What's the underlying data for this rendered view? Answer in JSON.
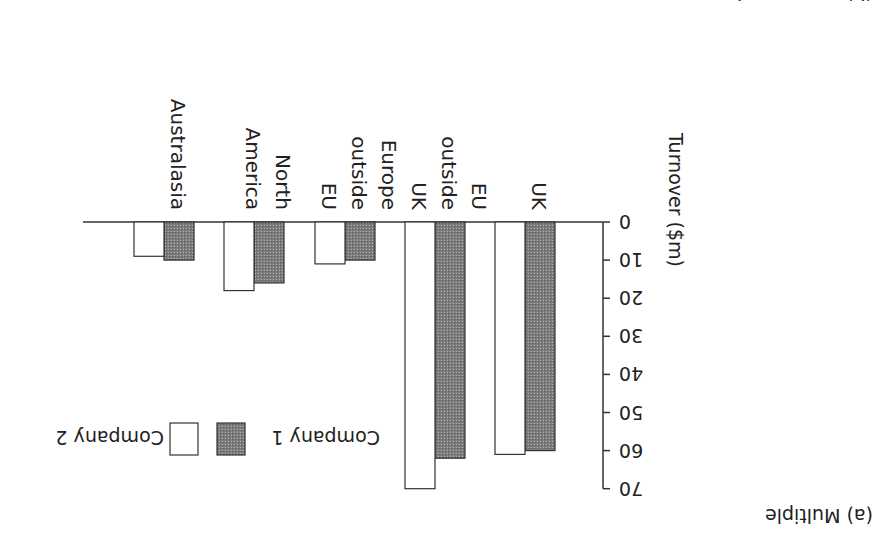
{
  "panel_label": "(a) Multiple",
  "next_panel_label_partial": "(b) Compound",
  "colors": {
    "company1": "#8c8c8c",
    "company2": "#ffffff",
    "outline": "#333333"
  },
  "chart_data": {
    "type": "bar",
    "orientation_note": "image rendered rotated 180 degrees",
    "title": "(a) Multiple",
    "xlabel": "",
    "ylabel": "Turnover ($m)",
    "ylim": [
      0,
      70
    ],
    "yticks": [
      0,
      10,
      20,
      30,
      40,
      50,
      60,
      70
    ],
    "grid": false,
    "legend_position": "top-right",
    "categories": [
      "UK",
      "EU outside UK",
      "Europe outside EU",
      "North America",
      "Australasia"
    ],
    "category_lines": [
      [
        "UK"
      ],
      [
        "EU",
        "outside",
        "UK"
      ],
      [
        "Europe",
        "outside",
        "EU"
      ],
      [
        "North",
        "America"
      ],
      [
        "Australasia"
      ]
    ],
    "series": [
      {
        "name": "Company 1",
        "fill": "hatched gray",
        "values": [
          60,
          62,
          10,
          16,
          10
        ]
      },
      {
        "name": "Company 2",
        "fill": "white",
        "values": [
          61,
          70,
          11,
          18,
          9
        ]
      }
    ]
  },
  "legend": {
    "items": [
      {
        "label": "Company 1"
      },
      {
        "label": "Company 2"
      }
    ]
  }
}
